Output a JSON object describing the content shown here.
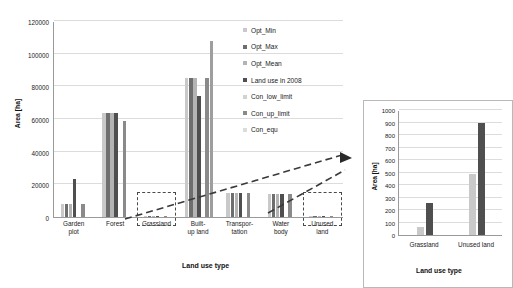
{
  "chart_data": [
    {
      "id": "main",
      "type": "bar",
      "title": "",
      "xlabel": "Land use type",
      "ylabel": "Area [ha]",
      "ylim": [
        0,
        120000
      ],
      "ytick_step": 20000,
      "yticks": [
        0,
        20000,
        40000,
        60000,
        80000,
        100000,
        120000
      ],
      "ytick_labels": [
        "0",
        "20000",
        "40000",
        "60000",
        "80000",
        "100000",
        "120000"
      ],
      "grid": true,
      "legend_position": "inside-right",
      "categories": [
        "Garden\nplot",
        "Forest",
        "Grassland",
        "Built-\nup land",
        "Transpor-\ntation",
        "Water\nbody",
        "Unused\nland"
      ],
      "series": [
        {
          "name": "Opt_Min",
          "color": "#c9c9c9",
          "values": [
            8000,
            63500,
            65,
            85000,
            14500,
            14000,
            490
          ]
        },
        {
          "name": "Opt_Max",
          "color": "#6e6e6e",
          "values": [
            8100,
            63800,
            65,
            85000,
            14500,
            14000,
            490
          ]
        },
        {
          "name": "Opt_Mean",
          "color": "#b4b4b4",
          "values": [
            8050,
            63600,
            65,
            85000,
            14500,
            14000,
            490
          ]
        },
        {
          "name": "Land use in 2008",
          "color": "#4f4f4f",
          "values": [
            23000,
            63500,
            255,
            74000,
            14600,
            14000,
            900
          ]
        },
        {
          "name": "Con_low_limit",
          "color": "#d2d2d2",
          "values": [
            0,
            0,
            0,
            0,
            0,
            0,
            0
          ]
        },
        {
          "name": "Con_up_limit",
          "color": "#8a8a8a",
          "values": [
            8050,
            59000,
            65,
            85000,
            14500,
            14000,
            490
          ]
        },
        {
          "name": "Con_equ",
          "color": "#9e9e9e",
          "values": [
            0,
            0,
            0,
            108000,
            0,
            0,
            0
          ]
        }
      ],
      "annotations": [
        {
          "label": "grassland-callout",
          "target": "Grassland"
        },
        {
          "label": "unused-land-callout",
          "target": "Unused land"
        }
      ]
    },
    {
      "id": "inset",
      "type": "bar",
      "title": "",
      "xlabel": "Land use type",
      "ylabel": "Area [ha]",
      "ylim": [
        0,
        1000
      ],
      "ytick_step": 100,
      "yticks": [
        0,
        100,
        200,
        300,
        400,
        500,
        600,
        700,
        800,
        900,
        1000
      ],
      "ytick_labels": [
        "0",
        "100",
        "200",
        "300",
        "400",
        "500",
        "600",
        "700",
        "800",
        "900",
        "1000"
      ],
      "grid": true,
      "categories": [
        "Grassland",
        "Unused land"
      ],
      "series": [
        {
          "name": "Opt_Mean",
          "color": "#c9c9c9",
          "values": [
            65,
            490
          ]
        },
        {
          "name": "Land use in 2008",
          "color": "#4f4f4f",
          "values": [
            255,
            900
          ]
        }
      ]
    }
  ],
  "legend": {
    "items": [
      {
        "label": "Opt_Min",
        "color": "#c9c9c9"
      },
      {
        "label": "Opt_Max",
        "color": "#6e6e6e"
      },
      {
        "label": "Opt_Mean",
        "color": "#b4b4b4"
      },
      {
        "label": "Land use in 2008",
        "color": "#4f4f4f"
      },
      {
        "label": "Con_low_limit",
        "color": "#d2d2d2"
      },
      {
        "label": "Con_up_limit",
        "color": "#8a8a8a"
      },
      {
        "label": "Con_equ",
        "color": "#dcdcdc"
      }
    ]
  },
  "colors": {
    "axis": "#9a9a9a",
    "grid": "#dcdcdc",
    "text": "#1a1a1a",
    "callout": "#4a4a4a",
    "inset_border": "#b9b9b9"
  }
}
